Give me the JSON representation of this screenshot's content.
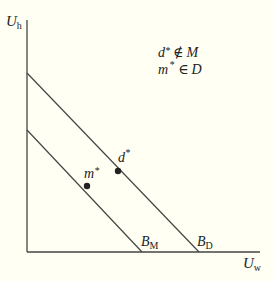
{
  "diagram": {
    "axes": {
      "y_label": "U",
      "y_label_sub": "h",
      "x_label": "U",
      "x_label_sub": "w"
    },
    "lines": [
      {
        "name": "B",
        "sub": "D",
        "from": [
          27,
          73
        ],
        "to": [
          199,
          252
        ]
      },
      {
        "name": "B",
        "sub": "M",
        "from": [
          27,
          130
        ],
        "to": [
          142,
          252
        ]
      }
    ],
    "points": [
      {
        "label": "d",
        "sup": "*",
        "x": 118,
        "y": 171
      },
      {
        "label": "m",
        "sup": "*",
        "x": 87,
        "y": 186
      }
    ],
    "legend": {
      "line1": {
        "var": "d",
        "sup": "*",
        "rel": "∉",
        "set": "M"
      },
      "line2": {
        "var": "m",
        "sup": "*",
        "rel": "∈",
        "set": "D"
      }
    },
    "colors": {
      "ink": "#333333",
      "background": "#fffff4"
    }
  }
}
